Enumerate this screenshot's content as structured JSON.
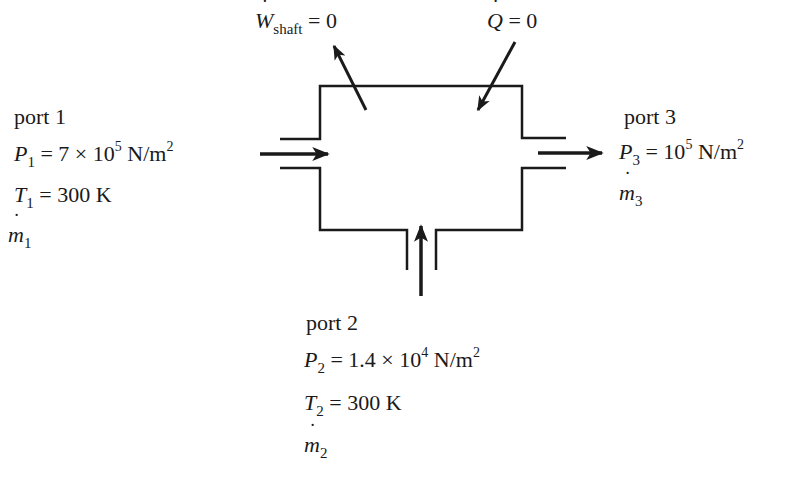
{
  "diagram": {
    "type": "control-volume schematic",
    "top": {
      "work": {
        "symbol": "W",
        "subscript": "shaft",
        "value": "= 0"
      },
      "heat": {
        "symbol": "Q",
        "value": "= 0"
      }
    },
    "ports": [
      {
        "id": "port1",
        "label": "port 1",
        "direction": "in",
        "pressure": {
          "symbol": "P",
          "sub": "1",
          "value": "= 7 × 10",
          "exp": "5",
          "unit": " N/m",
          "unit_exp": "2"
        },
        "temperature": {
          "symbol": "T",
          "sub": "1",
          "value": "= 300 K"
        },
        "mass_flow": {
          "symbol": "m",
          "sub": "1"
        }
      },
      {
        "id": "port2",
        "label": "port 2",
        "direction": "in",
        "pressure": {
          "symbol": "P",
          "sub": "2",
          "value": "= 1.4 × 10",
          "exp": "4",
          "unit": " N/m",
          "unit_exp": "2"
        },
        "temperature": {
          "symbol": "T",
          "sub": "2",
          "value": "= 300 K"
        },
        "mass_flow": {
          "symbol": "m",
          "sub": "2"
        }
      },
      {
        "id": "port3",
        "label": "port 3",
        "direction": "out",
        "pressure": {
          "symbol": "P",
          "sub": "3",
          "value": "= 10",
          "exp": "5",
          "unit": " N/m",
          "unit_exp": "2"
        },
        "mass_flow": {
          "symbol": "m",
          "sub": "3"
        }
      }
    ],
    "colors": {
      "line": "#1a1a1a",
      "background": "#ffffff"
    }
  }
}
